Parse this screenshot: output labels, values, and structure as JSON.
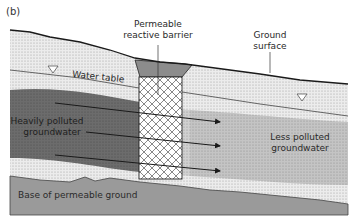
{
  "figure": {
    "panel_label": "(b)",
    "labels": {
      "barrier_line1": "Permeable",
      "barrier_line2": "reactive barrier",
      "ground_line1": "Ground",
      "ground_line2": "surface",
      "water_table": "Water table",
      "heavy_line1": "Heavily polluted",
      "heavy_line2": "groundwater",
      "less_line1": "Less polluted",
      "less_line2": "groundwater",
      "base": "Base of permeable ground"
    },
    "flow_arrows": 3,
    "colors": {
      "soil_light": "#e6e6e6",
      "heavy_plume": "#6e6e6e",
      "less_plume": "#bdbdbd",
      "base_layer": "#9a9a9a",
      "barrier_cap": "#8c8c8c",
      "line": "#1a1a1a"
    }
  }
}
